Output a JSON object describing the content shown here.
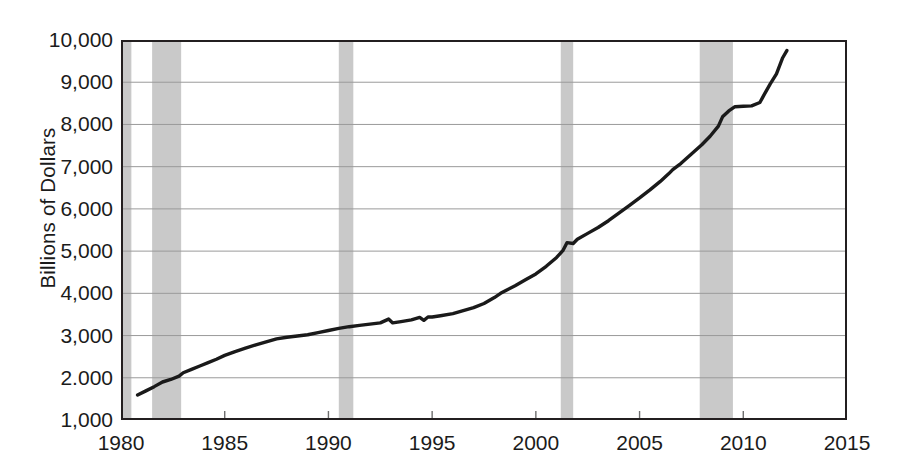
{
  "chart_data": {
    "type": "line",
    "title": "",
    "xlabel": "",
    "ylabel": "Billions of Dollars",
    "xlim": [
      1980,
      2015
    ],
    "ylim": [
      1000,
      10000
    ],
    "grid": true,
    "legend": "none",
    "xticks": [
      "1980",
      "1985",
      "1990",
      "1995",
      "2000",
      "2005",
      "2010",
      "2015"
    ],
    "xtick_values": [
      1980,
      1985,
      1990,
      1995,
      2000,
      2005,
      2010,
      2015
    ],
    "yticks": [
      "1,000",
      "2.000",
      "3,000",
      "4,000",
      "5,000",
      "6,000",
      "7,000",
      "8,000",
      "9,000",
      "10,000"
    ],
    "ytick_values": [
      1000,
      2000,
      3000,
      4000,
      5000,
      6000,
      7000,
      8000,
      9000,
      10000
    ],
    "series": [
      {
        "name": "Total debt outstanding",
        "color": "#1a1a1a",
        "x": [
          1980.8,
          1981.2,
          1981.6,
          1982.0,
          1982.4,
          1982.8,
          1983.0,
          1983.4,
          1983.8,
          1984.2,
          1984.6,
          1985.0,
          1985.5,
          1986.0,
          1986.5,
          1987.0,
          1987.5,
          1988.0,
          1988.5,
          1989.0,
          1989.5,
          1990.0,
          1990.5,
          1991.0,
          1991.5,
          1992.0,
          1992.5,
          1992.9,
          1993.1,
          1993.5,
          1994.0,
          1994.4,
          1994.6,
          1994.8,
          1995.0,
          1995.4,
          1996.0,
          1996.5,
          1997.0,
          1997.5,
          1998.0,
          1998.3,
          1998.6,
          1999.0,
          1999.5,
          2000.0,
          2000.5,
          2001.0,
          2001.3,
          2001.5,
          2001.8,
          2002.0,
          2002.5,
          2003.0,
          2003.5,
          2004.0,
          2004.5,
          2005.0,
          2005.5,
          2006.0,
          2006.4,
          2006.6,
          2007.0,
          2007.5,
          2008.0,
          2008.4,
          2008.8,
          2009.0,
          2009.3,
          2009.6,
          2010.0,
          2010.4,
          2010.8,
          2011.0,
          2011.3,
          2011.6,
          2011.9,
          2012.1
        ],
        "y": [
          1590,
          1690,
          1790,
          1900,
          1960,
          2040,
          2120,
          2200,
          2280,
          2360,
          2440,
          2530,
          2620,
          2700,
          2780,
          2850,
          2920,
          2960,
          2990,
          3020,
          3070,
          3120,
          3170,
          3210,
          3240,
          3270,
          3300,
          3390,
          3300,
          3330,
          3370,
          3430,
          3360,
          3440,
          3440,
          3470,
          3520,
          3590,
          3660,
          3760,
          3900,
          4000,
          4080,
          4180,
          4320,
          4460,
          4640,
          4850,
          5010,
          5200,
          5180,
          5280,
          5420,
          5560,
          5720,
          5900,
          6080,
          6260,
          6450,
          6650,
          6830,
          6930,
          7080,
          7300,
          7520,
          7720,
          7960,
          8180,
          8320,
          8420,
          8430,
          8440,
          8520,
          8700,
          8960,
          9200,
          9580,
          9750
        ]
      }
    ],
    "shaded_regions": {
      "label": "recession bands",
      "color": "#c9c9c9",
      "spans": [
        [
          1980.0,
          1980.5
        ],
        [
          1981.5,
          1982.9
        ],
        [
          1990.5,
          1991.2
        ],
        [
          2001.2,
          2001.8
        ],
        [
          2007.9,
          2009.5
        ]
      ]
    }
  }
}
